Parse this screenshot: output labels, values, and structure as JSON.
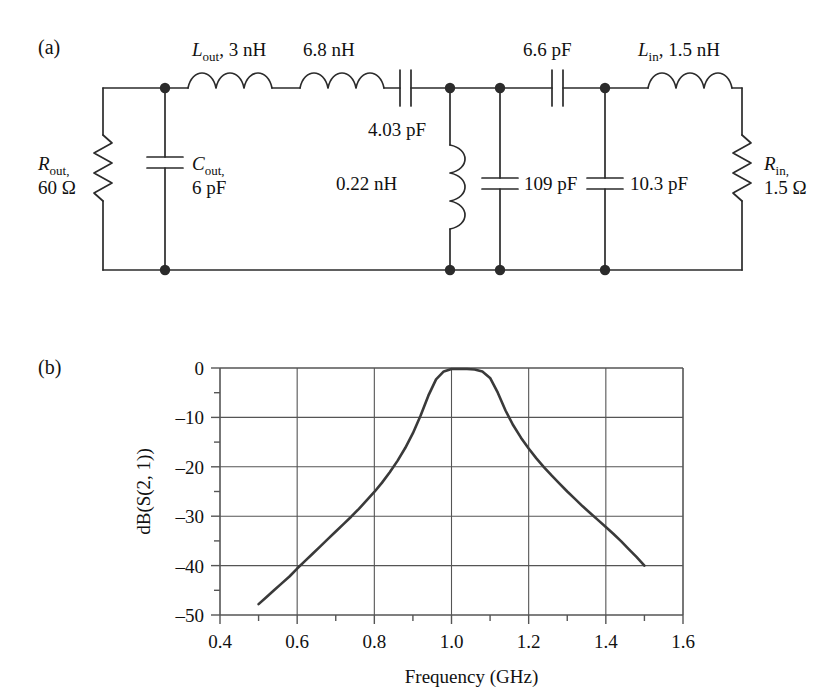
{
  "figure": {
    "panel_a_label": "(a)",
    "panel_b_label": "(b)"
  },
  "circuit": {
    "title": "Bandpass matching network schematic",
    "components": [
      {
        "id": "r_out",
        "name": "R_out",
        "symbol": "R",
        "sub": "out",
        "value": "60 Ω",
        "kind": "resistor",
        "orientation": "vertical",
        "label_line1": "R",
        "label_sub": "out,",
        "label_line2": "60 Ω"
      },
      {
        "id": "c_out",
        "name": "C_out",
        "symbol": "C",
        "sub": "out",
        "value": "6 pF",
        "kind": "capacitor",
        "orientation": "vertical",
        "label_line1": "C",
        "label_sub": "out,",
        "label_line2": "6 pF"
      },
      {
        "id": "l_out",
        "name": "L_out",
        "symbol": "L",
        "sub": "out",
        "value": "3 nH",
        "kind": "inductor",
        "orientation": "horizontal",
        "label_line1": "L",
        "label_sub": "out",
        "label_line2": ", 3 nH"
      },
      {
        "id": "l2",
        "name": "L2",
        "symbol": "",
        "sub": "",
        "value": "6.8 nH",
        "kind": "inductor",
        "orientation": "horizontal",
        "label_line2": "6.8 nH"
      },
      {
        "id": "c1",
        "name": "C1",
        "symbol": "",
        "sub": "",
        "value": "4.03 pF",
        "kind": "capacitor",
        "orientation": "horizontal",
        "label_line2": "4.03 pF"
      },
      {
        "id": "l3",
        "name": "L3",
        "symbol": "",
        "sub": "",
        "value": "0.22 nH",
        "kind": "inductor",
        "orientation": "vertical",
        "label_line2": "0.22 nH"
      },
      {
        "id": "c2",
        "name": "C2",
        "symbol": "",
        "sub": "",
        "value": "109 pF",
        "kind": "capacitor",
        "orientation": "vertical",
        "label_line2": "109 pF"
      },
      {
        "id": "c3",
        "name": "C3",
        "symbol": "",
        "sub": "",
        "value": "10.3 pF",
        "kind": "capacitor",
        "orientation": "vertical",
        "label_line2": "10.3 pF"
      },
      {
        "id": "c4",
        "name": "C4",
        "symbol": "",
        "sub": "",
        "value": "6.6 pF",
        "kind": "capacitor",
        "orientation": "horizontal",
        "label_line2": "6.6 pF"
      },
      {
        "id": "l_in",
        "name": "L_in",
        "symbol": "L",
        "sub": "in",
        "value": "1.5 nH",
        "kind": "inductor",
        "orientation": "horizontal",
        "label_line1": "L",
        "label_sub": "in",
        "label_line2": ", 1.5 nH"
      },
      {
        "id": "r_in",
        "name": "R_in",
        "symbol": "R",
        "sub": "in",
        "value": "1.5 Ω",
        "kind": "resistor",
        "orientation": "vertical",
        "label_line1": "R",
        "label_sub": "in,",
        "label_line2": "1.5 Ω"
      }
    ],
    "labels": {
      "l_out_sym": "L",
      "l_out_sub": "out",
      "l_out_val": ", 3 nH",
      "l2_val": "6.8 nH",
      "c1_val": "4.03 pF",
      "c4_val": "6.6 pF",
      "l_in_sym": "L",
      "l_in_sub": "in",
      "l_in_val": ", 1.5 nH",
      "r_out_sym": "R",
      "r_out_sub": "out,",
      "r_out_val": "60 Ω",
      "c_out_sym": "C",
      "c_out_sub": "out,",
      "c_out_val": "6 pF",
      "l3_val": "0.22 nH",
      "c2_val": "109 pF",
      "c3_val": "10.3 pF",
      "r_in_sym": "R",
      "r_in_sub": "in,",
      "r_in_val": "1.5 Ω"
    }
  },
  "chart_data": {
    "type": "line",
    "title": "",
    "xlabel": "Frequency (GHz)",
    "ylabel": "dB(S(2, 1))",
    "xlim": [
      0.4,
      1.6
    ],
    "ylim": [
      -50,
      0
    ],
    "xticks": [
      0.4,
      0.6,
      0.8,
      1.0,
      1.2,
      1.4,
      1.6
    ],
    "xticklabels": [
      "0.4",
      "0.6",
      "0.8",
      "1.0",
      "1.2",
      "1.4",
      "1.6"
    ],
    "yticks": [
      0,
      -10,
      -20,
      -30,
      -40,
      -50
    ],
    "yticklabels": [
      "0",
      "–10",
      "–20",
      "–30",
      "–40",
      "–50"
    ],
    "x_minor_step": 0.1,
    "y_minor_step": 5,
    "grid": true,
    "legend": null,
    "line_color": "#3a3a3a",
    "series": [
      {
        "name": "dB(S(2,1))",
        "x": [
          0.5,
          0.52,
          0.54,
          0.56,
          0.58,
          0.6,
          0.62,
          0.64,
          0.66,
          0.68,
          0.7,
          0.72,
          0.74,
          0.76,
          0.78,
          0.8,
          0.82,
          0.84,
          0.86,
          0.88,
          0.9,
          0.92,
          0.94,
          0.96,
          0.98,
          1.0,
          1.02,
          1.04,
          1.06,
          1.08,
          1.1,
          1.12,
          1.14,
          1.16,
          1.18,
          1.2,
          1.22,
          1.24,
          1.26,
          1.28,
          1.3,
          1.32,
          1.34,
          1.36,
          1.38,
          1.4,
          1.42,
          1.44,
          1.46,
          1.48,
          1.5
        ],
        "y": [
          -47.8,
          -46.4,
          -45.0,
          -43.6,
          -42.2,
          -40.6,
          -39.1,
          -37.6,
          -36.1,
          -34.6,
          -33.1,
          -31.6,
          -30.1,
          -28.5,
          -26.8,
          -25.1,
          -23.2,
          -21.1,
          -18.8,
          -16.2,
          -13.2,
          -9.6,
          -5.6,
          -2.3,
          -0.7,
          -0.2,
          -0.2,
          -0.2,
          -0.3,
          -0.7,
          -2.0,
          -5.0,
          -8.6,
          -11.6,
          -14.1,
          -16.3,
          -18.3,
          -20.1,
          -21.8,
          -23.4,
          -25.0,
          -26.5,
          -28.0,
          -29.4,
          -30.8,
          -32.2,
          -33.6,
          -35.1,
          -36.7,
          -38.3,
          -40.0
        ]
      }
    ]
  }
}
